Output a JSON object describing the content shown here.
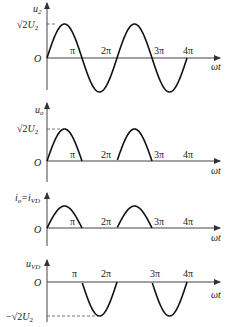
{
  "figure": "Half-wave rectifier waveforms",
  "x_axis_label": "ωt",
  "origin_label": "O",
  "x_ticks": [
    "π",
    "2π",
    "3π",
    "4π"
  ],
  "panels": [
    {
      "id": "u2",
      "ylabel_main": "u",
      "ylabel_sub": "2",
      "level_label": "√2U₂",
      "level_label_parts": {
        "prefix": "",
        "sqrt": "√2",
        "U": "U",
        "sub": "2"
      },
      "waveform": "sine",
      "amplitude": 1
    },
    {
      "id": "uo",
      "ylabel_main": "u",
      "ylabel_sub": "o",
      "level_label": "√2U₂",
      "level_label_parts": {
        "prefix": "",
        "sqrt": "√2",
        "U": "U",
        "sub": "2"
      },
      "waveform": "positive-half",
      "amplitude": 1
    },
    {
      "id": "io",
      "ylabel_main": "i",
      "ylabel_sub": "o",
      "ylabel_extra_main": "=i",
      "ylabel_extra_sub": "VD",
      "level_label": "",
      "waveform": "positive-half",
      "amplitude": 1
    },
    {
      "id": "uvd",
      "ylabel_main": "u",
      "ylabel_sub": "VD",
      "level_label": "−√2U₂",
      "level_label_parts": {
        "prefix": "−",
        "sqrt": "√2",
        "U": "U",
        "sub": "2"
      },
      "waveform": "negative-half",
      "amplitude": 1
    }
  ]
}
